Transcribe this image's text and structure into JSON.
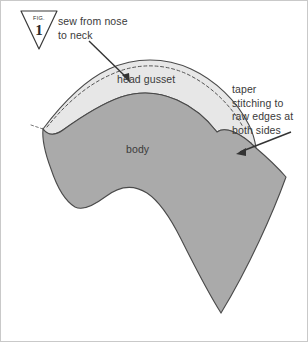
{
  "figure": {
    "badge": {
      "caption": "FIG.",
      "number": "1"
    },
    "annotations": {
      "sew": "sew from nose\nto neck",
      "taper": "taper\nstitching to\nraw edges at\nboth sides"
    },
    "labels": {
      "head_gusset": "head gusset",
      "body": "body"
    },
    "icons": {
      "arrow_to_gusset": "arrow-down-right-icon",
      "arrow_to_taper": "arrow-left-icon",
      "badge_triangle": "triangle-down-icon"
    },
    "colors": {
      "gusset_fill": "#e7e7e7",
      "body_fill": "#aaaaaa",
      "outline": "#444444",
      "stitch_dash": "#5a5a5a",
      "text": "#3a3a3a",
      "frame": "#c9c9c9",
      "background": "#ffffff"
    }
  }
}
